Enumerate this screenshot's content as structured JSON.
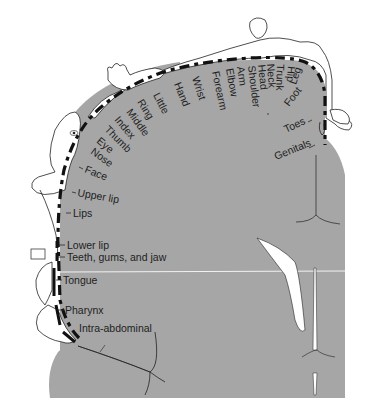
{
  "diagram": {
    "colors": {
      "cortex_fill": "#a6a6a6",
      "background": "#ffffff",
      "line": "#1e1e1e",
      "label_text": "#1e1e1e"
    },
    "labels": {
      "genitals": "Genitals",
      "toes": "Toes",
      "foot": "Foot",
      "leg": "Leg",
      "hip": "Hip",
      "trunk": "Trunk",
      "neck": "Neck",
      "head": "Head",
      "shoulder": "Shoulder",
      "arm": "Arm",
      "elbow": "Elbow",
      "forearm": "Forearm",
      "wrist": "Wrist",
      "hand": "Hand",
      "little": "Little",
      "ring": "Ring",
      "middle": "Middle",
      "index": "Index",
      "thumb": "Thumb",
      "eye": "Eye",
      "nose": "Nose",
      "face": "Face",
      "upper_lip": "Upper lip",
      "lips": "Lips",
      "lower_lip": "Lower lip",
      "teeth": "Teeth, gums, and jaw",
      "tongue": "Tongue",
      "pharynx": "Pharynx",
      "intra_abdominal": "Intra-abdominal"
    }
  }
}
